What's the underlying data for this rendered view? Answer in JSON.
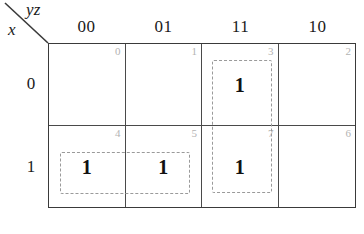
{
  "diagram": {
    "type": "karnaugh-map",
    "variables_top_label": "yz",
    "variables_side_label": "x",
    "column_headers": [
      "00",
      "01",
      "11",
      "10"
    ],
    "row_headers": [
      "0",
      "1"
    ],
    "cells": [
      {
        "index": "0",
        "value": "",
        "row": 0,
        "col": 0
      },
      {
        "index": "1",
        "value": "",
        "row": 0,
        "col": 1
      },
      {
        "index": "3",
        "value": "1",
        "row": 0,
        "col": 2
      },
      {
        "index": "2",
        "value": "",
        "row": 0,
        "col": 3
      },
      {
        "index": "4",
        "value": "1",
        "row": 1,
        "col": 0
      },
      {
        "index": "5",
        "value": "1",
        "row": 1,
        "col": 1
      },
      {
        "index": "7",
        "value": "1",
        "row": 1,
        "col": 2
      },
      {
        "index": "6",
        "value": "",
        "row": 1,
        "col": 3
      }
    ],
    "groups": [
      {
        "name": "group-cells-4-5",
        "cells": [
          "4",
          "5"
        ],
        "orientation": "horizontal"
      },
      {
        "name": "group-cells-3-7",
        "cells": [
          "3",
          "7"
        ],
        "orientation": "vertical"
      }
    ],
    "colors": {
      "grid_line": "#4a4a4a",
      "border": "#3a3a3a",
      "index_text": "#b3b3b3",
      "value_text": "#111111",
      "group_dash": "#9a9a9a",
      "background": "#ffffff"
    }
  }
}
